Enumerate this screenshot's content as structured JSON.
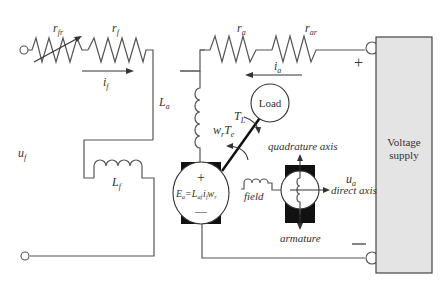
{
  "diagram": {
    "field_circuit": {
      "voltage_label": "u",
      "voltage_sub": "f",
      "rheostat_label": "r",
      "rheostat_sub": "fr",
      "resistor_label": "r",
      "resistor_sub": "f",
      "current_label": "i",
      "current_sub": "f",
      "inductor_label": "L",
      "inductor_sub": "f"
    },
    "armature_circuit": {
      "voltage_label": "u",
      "voltage_sub": "a",
      "resistor_label": "r",
      "resistor_sub": "a",
      "ext_resistor_label": "r",
      "ext_resistor_sub": "ar",
      "current_label": "i",
      "current_sub": "a",
      "inductor_label": "L",
      "inductor_sub": "a",
      "plus_sign": "+",
      "minus_sign": "—"
    },
    "machine": {
      "emf_E": "E",
      "emf_E_sub": "a",
      "emf_eq": "=",
      "emf_L": "L",
      "emf_L_sub": "af",
      "emf_i": "i",
      "emf_i_sub": "f",
      "emf_w": "w",
      "emf_w_sub": "r",
      "plus": "+",
      "minus": "—",
      "speed_torque_w": "w",
      "speed_torque_w_sub": "r",
      "speed_torque_T": "T",
      "speed_torque_T_sub": "e",
      "load_torque": "T",
      "load_torque_sub": "L",
      "load_label": "Load"
    },
    "axes_detail": {
      "quadrature": "quadrature axis",
      "direct": "direct axis",
      "field": "field",
      "armature": "armature"
    },
    "supply": {
      "line1": "Voltage",
      "line2": "supply",
      "fill": "#e4e4e4"
    }
  }
}
